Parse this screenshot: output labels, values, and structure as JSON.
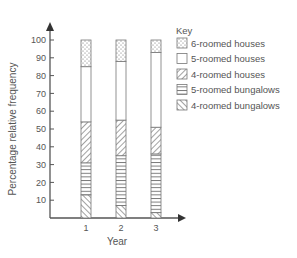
{
  "chart_data": {
    "type": "bar",
    "stacked": true,
    "title": "",
    "xlabel": "Year",
    "ylabel": "Percentage relative frequency",
    "categories": [
      "1",
      "2",
      "3"
    ],
    "ylim": [
      0,
      100
    ],
    "yticks": [
      10,
      20,
      30,
      40,
      50,
      60,
      70,
      80,
      90,
      100
    ],
    "grid": false,
    "legend_title": "Key",
    "legend_position": "top-right",
    "series": [
      {
        "name": "4-roomed bungalows",
        "pattern": "diagonal-up",
        "values": [
          13,
          7,
          3
        ]
      },
      {
        "name": "5-roomed bungalows",
        "pattern": "horizontal",
        "values": [
          18,
          28,
          33
        ]
      },
      {
        "name": "4-roomed houses",
        "pattern": "diagonal-down",
        "values": [
          23,
          20,
          15
        ]
      },
      {
        "name": "5-roomed houses",
        "pattern": "blank",
        "values": [
          31,
          33,
          42
        ]
      },
      {
        "name": "6-roomed houses",
        "pattern": "dotted",
        "values": [
          15,
          12,
          7
        ]
      }
    ],
    "cumulative_boundaries": {
      "1": [
        13,
        31,
        54,
        85,
        100
      ],
      "2": [
        7,
        35,
        55,
        88,
        100
      ],
      "3": [
        3,
        36,
        51,
        93,
        100
      ]
    }
  },
  "legend": {
    "title": "Key",
    "items": [
      {
        "label": "6-roomed houses",
        "pattern": "dotted"
      },
      {
        "label": "5-roomed houses",
        "pattern": "blank"
      },
      {
        "label": "4-roomed houses",
        "pattern": "diagonal-down"
      },
      {
        "label": "5-roomed bungalows",
        "pattern": "horizontal"
      },
      {
        "label": "4-roomed bungalows",
        "pattern": "diagonal-up"
      }
    ]
  },
  "axes": {
    "x_title": "Year",
    "y_title": "Percentage relative frequency",
    "x_ticks": [
      "1",
      "2",
      "3"
    ],
    "y_ticks": [
      "10",
      "20",
      "30",
      "40",
      "50",
      "60",
      "70",
      "80",
      "90",
      "100"
    ]
  },
  "colors": {
    "axis": "#555555",
    "bar_outline": "#777777",
    "pattern": "#666666",
    "text": "#555555"
  }
}
